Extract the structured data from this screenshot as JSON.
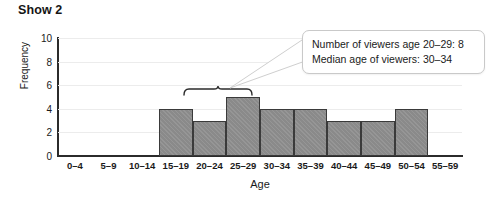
{
  "chart_data": {
    "type": "bar",
    "title": "Show 2",
    "xlabel": "Age",
    "ylabel": "Frequency",
    "categories": [
      "0–4",
      "5–9",
      "10–14",
      "15–19",
      "20–24",
      "25–29",
      "30–34",
      "35–39",
      "40–44",
      "45–49",
      "50–54",
      "55–59"
    ],
    "values": [
      0,
      0,
      0,
      4,
      3,
      5,
      4,
      4,
      3,
      3,
      4,
      0
    ],
    "ylim": [
      0,
      10
    ],
    "y_ticks": [
      0,
      2,
      4,
      6,
      8,
      10
    ],
    "grid": true,
    "legend": "none",
    "bar_color": "#8a8a8a",
    "bar_border_color": "#3a3a3a",
    "gridline_color": "#ececec",
    "axis_color": "#2b2b2b",
    "annotations": [
      {
        "type": "brace",
        "name": "bracket-over-20-29",
        "spans": [
          "20–24",
          "25–29"
        ]
      },
      {
        "type": "callout",
        "name": "stats-callout",
        "lines": [
          "Number of viewers age 20–29: 8",
          "Median age of viewers: 30–34"
        ]
      }
    ]
  },
  "callout": {
    "line1": "Number of viewers age 20–29: 8",
    "line2": "Median age of viewers: 30–34"
  }
}
